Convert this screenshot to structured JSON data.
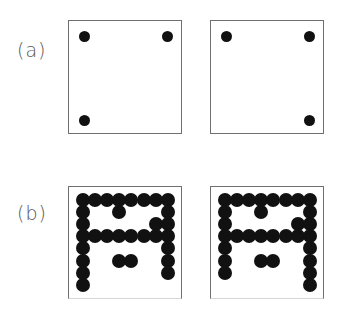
{
  "figure": {
    "panels": [
      {
        "label": "(a)",
        "boxes": [
          {
            "name": "a-left",
            "dots": [
              [
                15,
                15
              ],
              [
                98,
                15
              ],
              [
                15,
                99
              ]
            ]
          },
          {
            "name": "a-right",
            "dots": [
              [
                15,
                15
              ],
              [
                98,
                15
              ],
              [
                98,
                99
              ]
            ]
          }
        ]
      },
      {
        "label": "(b)",
        "grid": {
          "cols": 8,
          "rows": 8,
          "spacing": 12.1
        },
        "boxes": [
          {
            "name": "b-left",
            "cells": [
              [
                0,
                0
              ],
              [
                1,
                0
              ],
              [
                2,
                0
              ],
              [
                3,
                0
              ],
              [
                4,
                0
              ],
              [
                5,
                0
              ],
              [
                6,
                0
              ],
              [
                7,
                0
              ],
              [
                0,
                1
              ],
              [
                3,
                1
              ],
              [
                7,
                1
              ],
              [
                0,
                2
              ],
              [
                6,
                2
              ],
              [
                7,
                2
              ],
              [
                0,
                3
              ],
              [
                1,
                3
              ],
              [
                2,
                3
              ],
              [
                3,
                3
              ],
              [
                4,
                3
              ],
              [
                5,
                3
              ],
              [
                6,
                3
              ],
              [
                7,
                3
              ],
              [
                0,
                4
              ],
              [
                7,
                4
              ],
              [
                0,
                5
              ],
              [
                3,
                5
              ],
              [
                4,
                5
              ],
              [
                7,
                5
              ],
              [
                0,
                6
              ],
              [
                7,
                6
              ],
              [
                0,
                7
              ]
            ]
          },
          {
            "name": "b-right",
            "cells": [
              [
                0,
                0
              ],
              [
                1,
                0
              ],
              [
                2,
                0
              ],
              [
                3,
                0
              ],
              [
                4,
                0
              ],
              [
                5,
                0
              ],
              [
                6,
                0
              ],
              [
                7,
                0
              ],
              [
                0,
                1
              ],
              [
                3,
                1
              ],
              [
                7,
                1
              ],
              [
                0,
                2
              ],
              [
                6,
                2
              ],
              [
                7,
                2
              ],
              [
                0,
                3
              ],
              [
                1,
                3
              ],
              [
                2,
                3
              ],
              [
                3,
                3
              ],
              [
                4,
                3
              ],
              [
                5,
                3
              ],
              [
                6,
                3
              ],
              [
                7,
                3
              ],
              [
                0,
                4
              ],
              [
                7,
                4
              ],
              [
                0,
                5
              ],
              [
                3,
                5
              ],
              [
                4,
                5
              ],
              [
                7,
                5
              ],
              [
                0,
                6
              ],
              [
                7,
                6
              ],
              [
                7,
                7
              ]
            ]
          }
        ]
      }
    ]
  }
}
